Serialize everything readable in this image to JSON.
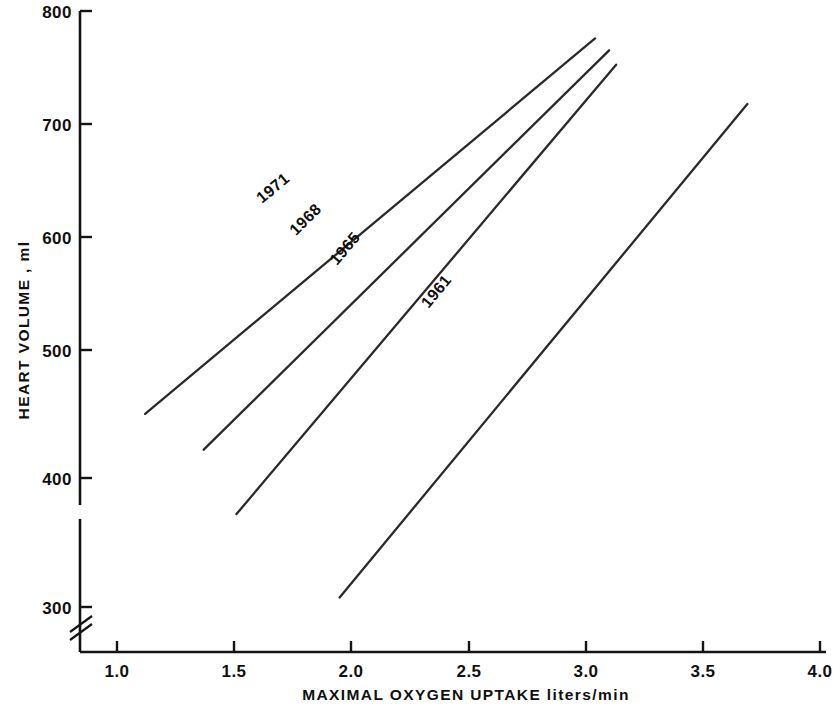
{
  "chart_data": {
    "type": "line",
    "title": "",
    "xlabel": "MAXIMAL  OXYGEN  UPTAKE  liters/min",
    "ylabel": "HEART  VOLUME , ml",
    "xlim": [
      0.85,
      4.05
    ],
    "ylim": [
      285,
      805
    ],
    "grid": false,
    "legend": "inline-labels-on-lines",
    "y_axis_break": true,
    "y_axis_break_note": "axis broken below 300",
    "xticks": [
      "1.0",
      "1.5",
      "2.0",
      "2.5",
      "3.0",
      "3.5",
      "4.0"
    ],
    "xtick_values": [
      1.0,
      1.5,
      2.0,
      2.5,
      3.0,
      3.5,
      4.0
    ],
    "yticks": [
      "300",
      "400",
      "500",
      "600",
      "700",
      "800"
    ],
    "ytick_values": [
      300,
      400,
      500,
      600,
      700,
      800
    ],
    "series": [
      {
        "name": "1971",
        "label": "1971",
        "x": [
          1.12,
          3.04
        ],
        "y": [
          462,
          777
        ],
        "label_x": 1.68,
        "label_y": 648
      },
      {
        "name": "1968",
        "label": "1968",
        "x": [
          1.37,
          3.1
        ],
        "y": [
          432,
          767
        ],
        "label_x": 1.82,
        "label_y": 622
      },
      {
        "name": "1965",
        "label": "1965",
        "x": [
          1.51,
          3.13
        ],
        "y": [
          378,
          755
        ],
        "label_x": 1.99,
        "label_y": 598
      },
      {
        "name": "1961",
        "label": "1961",
        "x": [
          1.95,
          3.69
        ],
        "y": [
          308,
          722
        ],
        "label_x": 2.38,
        "label_y": 562
      }
    ]
  },
  "axes": {
    "x_title": "MAXIMAL  OXYGEN  UPTAKE  liters/min",
    "y_title": "HEART  VOLUME , ml"
  }
}
